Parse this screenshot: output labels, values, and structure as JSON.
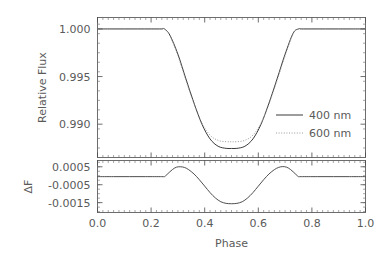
{
  "figure": {
    "title": "",
    "xlabel": "Phase",
    "legend": {
      "position": "center-right-upper-panel",
      "entries": [
        {
          "label": "400 nm",
          "style": "solid",
          "color": "#3b3b3b"
        },
        {
          "label": "600 nm",
          "style": "dotted",
          "color": "#8f8f8f"
        }
      ]
    }
  },
  "chart_data": [
    {
      "type": "line",
      "panel": "upper",
      "title": "",
      "xlabel": "",
      "ylabel": "Relative Flux",
      "xlim": [
        0.0,
        1.0
      ],
      "ylim": [
        0.9865,
        1.0012
      ],
      "xticks": [
        "0.0",
        "0.2",
        "0.4",
        "0.6",
        "0.8",
        "1.0"
      ],
      "xtick_values": [
        0.0,
        0.2,
        0.4,
        0.6,
        0.8,
        1.0
      ],
      "yticks": [
        "1.000",
        "0.995",
        "0.990"
      ],
      "ytick_values": [
        1.0,
        0.995,
        0.99
      ],
      "grid": false,
      "transit": {
        "ingress_phase": 0.25,
        "egress_phase": 0.75,
        "center_phase": 0.5
      },
      "series": [
        {
          "name": "400 nm",
          "style": "solid",
          "color": "#3b3b3b",
          "depth": 0.01255,
          "min_flux": 0.98745,
          "limb_darkening_u": 0.72,
          "x": [
            0.0,
            0.05,
            0.1,
            0.15,
            0.2,
            0.24,
            0.25,
            0.27,
            0.3,
            0.33,
            0.36,
            0.39,
            0.42,
            0.45,
            0.48,
            0.5,
            0.52,
            0.55,
            0.58,
            0.61,
            0.64,
            0.67,
            0.7,
            0.73,
            0.75,
            0.76,
            0.8,
            0.85,
            0.9,
            0.95,
            1.0
          ],
          "y": [
            1.0,
            1.0,
            1.0,
            1.0,
            1.0,
            1.0,
            1.0,
            0.99935,
            0.99735,
            0.99475,
            0.99222,
            0.98998,
            0.98845,
            0.98768,
            0.98746,
            0.98745,
            0.98746,
            0.98768,
            0.98845,
            0.98998,
            0.99222,
            0.99475,
            0.99735,
            0.99955,
            1.0,
            1.0,
            1.0,
            1.0,
            1.0,
            1.0,
            1.0
          ]
        },
        {
          "name": "600 nm",
          "style": "dotted",
          "color": "#8f8f8f",
          "depth": 0.01185,
          "min_flux": 0.98815,
          "limb_darkening_u": 0.58,
          "x": [
            0.0,
            0.05,
            0.1,
            0.15,
            0.2,
            0.24,
            0.25,
            0.27,
            0.3,
            0.33,
            0.36,
            0.39,
            0.42,
            0.45,
            0.48,
            0.5,
            0.52,
            0.55,
            0.58,
            0.61,
            0.64,
            0.67,
            0.7,
            0.73,
            0.75,
            0.76,
            0.8,
            0.85,
            0.9,
            0.95,
            1.0
          ],
          "y": [
            1.0,
            1.0,
            1.0,
            1.0,
            1.0,
            1.0,
            1.0,
            0.99928,
            0.99718,
            0.99459,
            0.99215,
            0.9901,
            0.98885,
            0.9883,
            0.98816,
            0.98815,
            0.98816,
            0.9883,
            0.98885,
            0.9901,
            0.99215,
            0.99459,
            0.99718,
            0.9995,
            1.0,
            1.0,
            1.0,
            1.0,
            1.0,
            1.0,
            1.0
          ]
        }
      ]
    },
    {
      "type": "line",
      "panel": "lower",
      "title": "",
      "xlabel": "Phase",
      "ylabel": "ΔF",
      "xlim": [
        0.0,
        1.0
      ],
      "ylim": [
        -0.00205,
        0.00085
      ],
      "xticks": [
        "0.0",
        "0.2",
        "0.4",
        "0.6",
        "0.8",
        "1.0"
      ],
      "xtick_values": [
        0.0,
        0.2,
        0.4,
        0.6,
        0.8,
        1.0
      ],
      "yticks": [
        "0.0005",
        "-0.0005",
        "-0.0015"
      ],
      "ytick_values": [
        0.0005,
        -0.0005,
        -0.0015
      ],
      "grid": false,
      "series": [
        {
          "name": "ΔF (400 nm - 600 nm)",
          "style": "solid",
          "color": "#3b3b3b",
          "peak_positive": 0.0005,
          "peak_positive_phase": 0.31,
          "peak_negative": -0.00155,
          "peak_negative_phase": 0.5,
          "x": [
            0.0,
            0.06,
            0.12,
            0.18,
            0.24,
            0.25,
            0.26,
            0.28,
            0.295,
            0.31,
            0.325,
            0.34,
            0.36,
            0.38,
            0.4,
            0.42,
            0.44,
            0.46,
            0.48,
            0.5,
            0.52,
            0.54,
            0.56,
            0.58,
            0.6,
            0.62,
            0.64,
            0.66,
            0.675,
            0.69,
            0.705,
            0.72,
            0.74,
            0.75,
            0.76,
            0.82,
            0.88,
            0.94,
            1.0
          ],
          "y": [
            -5e-05,
            -5e-05,
            -5e-05,
            -5e-05,
            -5e-05,
            -5e-05,
            8e-05,
            0.00035,
            0.00048,
            0.0005,
            0.00046,
            0.00034,
            0.0001,
            -0.00022,
            -0.00058,
            -0.00094,
            -0.00124,
            -0.00145,
            -0.00154,
            -0.00156,
            -0.00154,
            -0.00145,
            -0.00124,
            -0.00094,
            -0.00058,
            -0.00022,
            0.0001,
            0.00034,
            0.00046,
            0.00051,
            0.00048,
            0.00035,
            8e-05,
            -5e-05,
            -5e-05,
            -5e-05,
            -5e-05,
            -5e-05,
            -5e-05
          ]
        }
      ]
    }
  ]
}
